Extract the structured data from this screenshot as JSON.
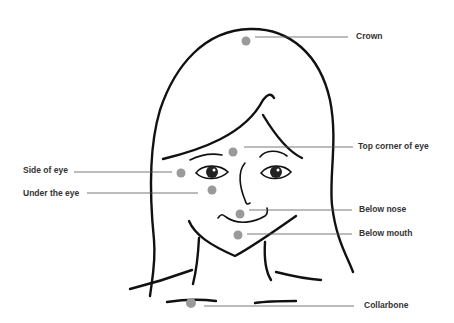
{
  "diagram": {
    "title": "",
    "point_color": "#9a9a9a",
    "line_color": "#555555",
    "points": [
      {
        "id": "crown",
        "label": "Crown",
        "dot": [
          246,
          41
        ],
        "label_pos": [
          356,
          31
        ],
        "side": "right"
      },
      {
        "id": "top-corner-eye",
        "label": "Top corner of eye",
        "dot": [
          233,
          152
        ],
        "label_pos": [
          358,
          140
        ],
        "side": "right"
      },
      {
        "id": "side-eye",
        "label": "Side of eye",
        "dot": [
          181,
          173
        ],
        "label_pos": [
          23,
          165
        ],
        "side": "left"
      },
      {
        "id": "under-eye",
        "label": "Under the eye",
        "dot": [
          212,
          190
        ],
        "label_pos": [
          23,
          190
        ],
        "side": "left"
      },
      {
        "id": "below-nose",
        "label": "Below nose",
        "dot": [
          240,
          214
        ],
        "label_pos": [
          359,
          205
        ],
        "side": "right"
      },
      {
        "id": "below-mouth",
        "label": "Below mouth",
        "dot": [
          238,
          235
        ],
        "label_pos": [
          359,
          228
        ],
        "side": "right"
      },
      {
        "id": "collarbone",
        "label": "Collarbone",
        "dot": [
          191,
          303
        ],
        "label_pos": [
          365,
          299
        ],
        "side": "right"
      }
    ]
  }
}
